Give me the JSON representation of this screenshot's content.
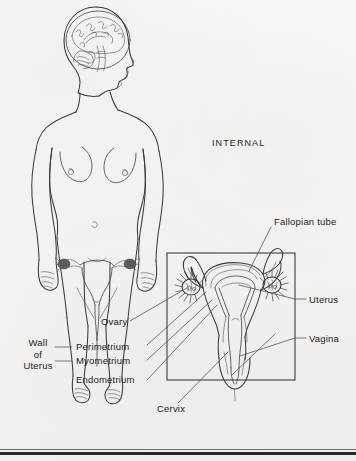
{
  "figure": {
    "section_heading": "INTERNAL",
    "background_color": "#f6f5f3",
    "ink_color": "#3a3a3a",
    "text_color": "#1c1c1c"
  },
  "labels": {
    "fallopian_tube": "Fallopian tube",
    "uterus": "Uterus",
    "vagina": "Vagina",
    "ovary": "Ovary",
    "perimetrium": "Perimetrium",
    "myometrium": "Myometrium",
    "endometrium": "Endometrium",
    "cervix": "Cervix",
    "wall_of_uterus_line1": "Wall",
    "wall_of_uterus_line2": "of",
    "wall_of_uterus_line3": "Uterus"
  },
  "diagram": {
    "inset_box": {
      "x": 167,
      "y": 253,
      "width": 128,
      "height": 127
    },
    "body_figure_caption": "female body with sagittal brain view and pelvic reproductive organs",
    "structures": [
      "brain",
      "head-profile",
      "torso",
      "breasts",
      "navel",
      "arms",
      "legs",
      "small-uterus-overlay",
      "enlarged-uterus-cross-section",
      "fallopian-tubes",
      "ovaries",
      "uterine-cavity",
      "cervix",
      "vaginal-canal"
    ]
  }
}
